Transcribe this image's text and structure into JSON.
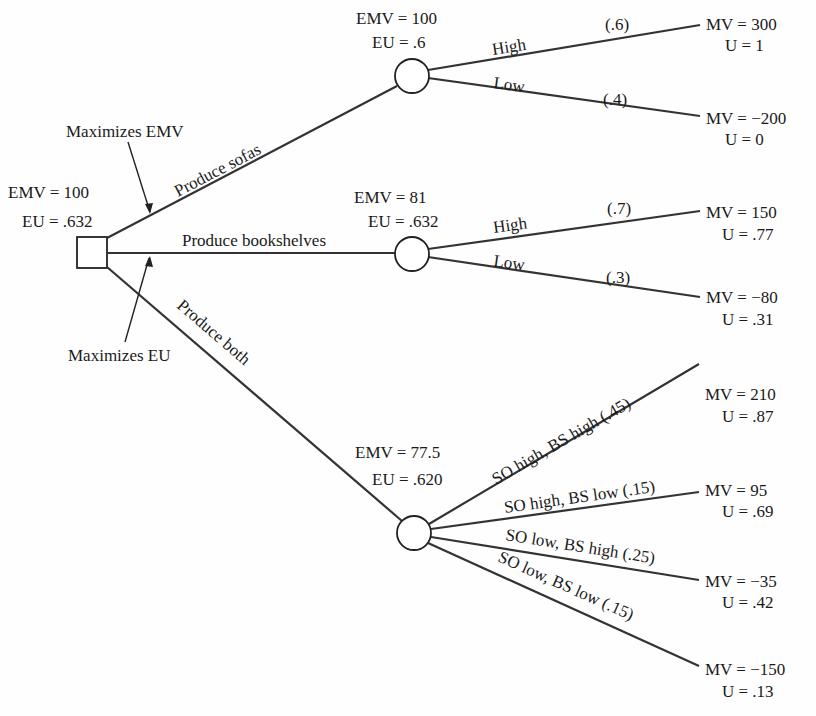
{
  "decision_node": {
    "emv_label": "EMV = 100",
    "eu_label": "EU = .632"
  },
  "annotations": {
    "maximizes_emv": "Maximizes EMV",
    "maximizes_eu": "Maximizes EU"
  },
  "alternatives": [
    {
      "label": "Produce sofas",
      "chance_node": {
        "emv_label": "EMV = 100",
        "eu_label": "EU = .6"
      },
      "outcomes": [
        {
          "label": "High",
          "prob": "(.6)",
          "mv": "MV = 300",
          "u": "U = 1"
        },
        {
          "label": "Low",
          "prob": "(.4)",
          "mv": "MV = −200",
          "u": "U = 0"
        }
      ]
    },
    {
      "label": "Produce bookshelves",
      "chance_node": {
        "emv_label": "EMV = 81",
        "eu_label": "EU = .632"
      },
      "outcomes": [
        {
          "label": "High",
          "prob": "(.7)",
          "mv": "MV = 150",
          "u": "U = .77"
        },
        {
          "label": "Low",
          "prob": "(.3)",
          "mv": "MV = −80",
          "u": "U = .31"
        }
      ]
    },
    {
      "label": "Produce both",
      "chance_node": {
        "emv_label": "EMV = 77.5",
        "eu_label": "EU = .620"
      },
      "outcomes": [
        {
          "label": "SO high, BS high (.45)",
          "mv": "MV = 210",
          "u": "U = .87"
        },
        {
          "label": "SO high, BS low (.15)",
          "mv": "MV = 95",
          "u": "U = .69"
        },
        {
          "label": "SO low, BS high (.25)",
          "mv": "MV = −35",
          "u": "U = .42"
        },
        {
          "label": "SO low, BS low (.15)",
          "mv": "MV = −150",
          "u": "U = .13"
        }
      ]
    }
  ]
}
